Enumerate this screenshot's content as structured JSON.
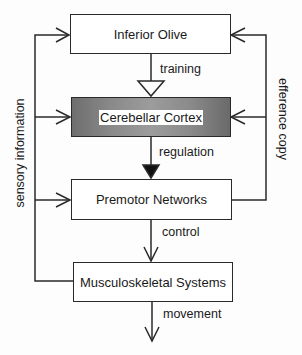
{
  "diagram": {
    "nodes": [
      {
        "id": "inferior-olive",
        "label": "Inferior Olive",
        "shaded": false
      },
      {
        "id": "cerebellar-cortex",
        "label": "Cerebellar Cortex",
        "shaded": true
      },
      {
        "id": "premotor-networks",
        "label": "Premotor Networks",
        "shaded": false
      },
      {
        "id": "musculoskeletal-systems",
        "label": "Musculoskeletal Systems",
        "shaded": false
      }
    ],
    "edges": [
      {
        "from": "inferior-olive",
        "to": "cerebellar-cortex",
        "label": "training",
        "arrow": "open-triangle"
      },
      {
        "from": "cerebellar-cortex",
        "to": "premotor-networks",
        "label": "regulation",
        "arrow": "filled-triangle"
      },
      {
        "from": "premotor-networks",
        "to": "musculoskeletal-systems",
        "label": "control",
        "arrow": "open-chevron"
      },
      {
        "from": "musculoskeletal-systems",
        "to": "output",
        "label": "movement",
        "arrow": "open-chevron"
      },
      {
        "from": "musculoskeletal-systems",
        "to": [
          "inferior-olive",
          "cerebellar-cortex",
          "premotor-networks"
        ],
        "label": "sensory information",
        "arrow": "open-chevron"
      },
      {
        "from": "premotor-networks",
        "to": [
          "inferior-olive",
          "cerebellar-cortex"
        ],
        "label": "efference copy",
        "arrow": "open-chevron"
      }
    ]
  }
}
